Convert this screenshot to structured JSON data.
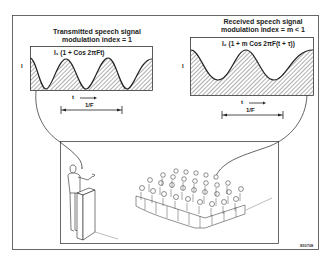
{
  "diagram": {
    "transmitted": {
      "title_line1": "Transmitted speech signal",
      "title_line2": "modulation index = 1",
      "formula": "I₁ (1 + Cos 2πFt)",
      "y_axis_label": "I",
      "time_label": "t",
      "period_label": "1/F"
    },
    "received": {
      "title_line1": "Received speech signal",
      "title_line2": "modulation index = m < 1",
      "formula": "I₂ (1 + m Cos 2πF(t + τ))",
      "y_axis_label": "I",
      "time_label": "t",
      "period_label": "1/F"
    },
    "scene": {
      "speaker": "speaker-at-podium",
      "audience": "seated-audience"
    },
    "figure_id": "850708",
    "colors": {
      "line": "#222222",
      "hatch": "#333333",
      "background": "#ffffff"
    }
  }
}
